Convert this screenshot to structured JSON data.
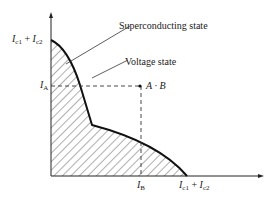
{
  "diagram": {
    "type": "critical-current-curve",
    "labels": {
      "y_top": {
        "var1": "I",
        "sub1": "c1",
        "plus": " + ",
        "var2": "I",
        "sub2": "c2"
      },
      "x_right": {
        "var1": "I",
        "sub1": "c1",
        "plus": " + ",
        "var2": "I",
        "sub2": "c2"
      },
      "ia": {
        "var": "I",
        "sub": "A"
      },
      "ib": {
        "var": "I",
        "sub": "B"
      },
      "superconducting": "Superconducting state",
      "voltage": "Voltage state",
      "point": "A · B"
    },
    "colors": {
      "line": "#222222",
      "background": "#ffffff"
    }
  }
}
